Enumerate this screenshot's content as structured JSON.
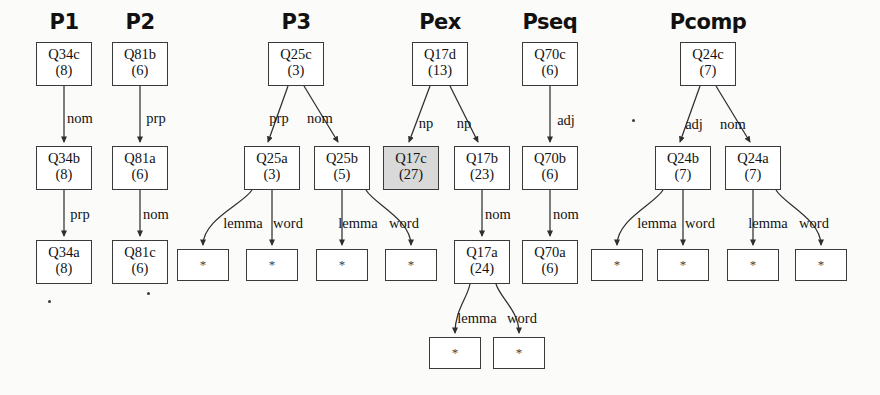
{
  "figure": {
    "background": "#fbfbf9",
    "node_fill": "#ffffff",
    "node_fill_highlight": "#d9d9d9",
    "stroke": "#3a3a3a",
    "leaf_symbol": "*"
  },
  "columns": [
    {
      "id": "p1",
      "label": "P1",
      "x": 64
    },
    {
      "id": "p2",
      "label": "P2",
      "x": 140
    },
    {
      "id": "p3",
      "label": "P3",
      "x": 296
    },
    {
      "id": "pex",
      "label": "Pex",
      "x": 440
    },
    {
      "id": "pseq",
      "label": "Pseq",
      "x": 550
    },
    {
      "id": "pcomp",
      "label": "Pcomp",
      "x": 708
    }
  ],
  "nodes": [
    {
      "id": "Q34c",
      "label": "Q34c",
      "count": "(8)",
      "cx": 64,
      "y": 42,
      "w": 56,
      "h": 44,
      "shaded": false
    },
    {
      "id": "Q34b",
      "label": "Q34b",
      "count": "(8)",
      "cx": 64,
      "y": 146,
      "w": 56,
      "h": 44,
      "shaded": false
    },
    {
      "id": "Q34a",
      "label": "Q34a",
      "count": "(8)",
      "cx": 64,
      "y": 240,
      "w": 56,
      "h": 44,
      "shaded": false
    },
    {
      "id": "Q81b",
      "label": "Q81b",
      "count": "(6)",
      "cx": 140,
      "y": 42,
      "w": 56,
      "h": 44,
      "shaded": false
    },
    {
      "id": "Q81a",
      "label": "Q81a",
      "count": "(6)",
      "cx": 140,
      "y": 146,
      "w": 56,
      "h": 44,
      "shaded": false
    },
    {
      "id": "Q81c",
      "label": "Q81c",
      "count": "(6)",
      "cx": 140,
      "y": 240,
      "w": 56,
      "h": 44,
      "shaded": false
    },
    {
      "id": "Q25c",
      "label": "Q25c",
      "count": "(3)",
      "cx": 296,
      "y": 42,
      "w": 56,
      "h": 44,
      "shaded": false
    },
    {
      "id": "Q25a",
      "label": "Q25a",
      "count": "(3)",
      "cx": 272,
      "y": 146,
      "w": 56,
      "h": 44,
      "shaded": false
    },
    {
      "id": "Q25b",
      "label": "Q25b",
      "count": "(5)",
      "cx": 342,
      "y": 146,
      "w": 56,
      "h": 44,
      "shaded": false
    },
    {
      "id": "Q17d",
      "label": "Q17d",
      "count": "(13)",
      "cx": 440,
      "y": 42,
      "w": 56,
      "h": 44,
      "shaded": false
    },
    {
      "id": "Q17c",
      "label": "Q17c",
      "count": "(27)",
      "cx": 411,
      "y": 146,
      "w": 56,
      "h": 44,
      "shaded": true
    },
    {
      "id": "Q17b",
      "label": "Q17b",
      "count": "(23)",
      "cx": 482,
      "y": 146,
      "w": 56,
      "h": 44,
      "shaded": false
    },
    {
      "id": "Q17a",
      "label": "Q17a",
      "count": "(24)",
      "cx": 482,
      "y": 240,
      "w": 56,
      "h": 44,
      "shaded": false
    },
    {
      "id": "Q70c",
      "label": "Q70c",
      "count": "(6)",
      "cx": 550,
      "y": 42,
      "w": 56,
      "h": 44,
      "shaded": false
    },
    {
      "id": "Q70b",
      "label": "Q70b",
      "count": "(6)",
      "cx": 550,
      "y": 146,
      "w": 56,
      "h": 44,
      "shaded": false
    },
    {
      "id": "Q70a",
      "label": "Q70a",
      "count": "(6)",
      "cx": 550,
      "y": 240,
      "w": 56,
      "h": 44,
      "shaded": false
    },
    {
      "id": "Q24c",
      "label": "Q24c",
      "count": "(7)",
      "cx": 708,
      "y": 42,
      "w": 56,
      "h": 44,
      "shaded": false
    },
    {
      "id": "Q24b",
      "label": "Q24b",
      "count": "(7)",
      "cx": 683,
      "y": 146,
      "w": 56,
      "h": 44,
      "shaded": false
    },
    {
      "id": "Q24a",
      "label": "Q24a",
      "count": "(7)",
      "cx": 753,
      "y": 146,
      "w": 56,
      "h": 44,
      "shaded": false
    }
  ],
  "leaves": [
    {
      "id": "leaf-p3-1",
      "symbol": "*",
      "cx": 203,
      "y": 249,
      "w": 52,
      "h": 32
    },
    {
      "id": "leaf-p3-2",
      "symbol": "*",
      "cx": 272,
      "y": 249,
      "w": 52,
      "h": 32
    },
    {
      "id": "leaf-p3-3",
      "symbol": "*",
      "cx": 342,
      "y": 249,
      "w": 52,
      "h": 32
    },
    {
      "id": "leaf-p3-4",
      "symbol": "*",
      "cx": 411,
      "y": 249,
      "w": 52,
      "h": 32
    },
    {
      "id": "leaf-pex-1",
      "symbol": "*",
      "cx": 455,
      "y": 337,
      "w": 52,
      "h": 32
    },
    {
      "id": "leaf-pex-2",
      "symbol": "*",
      "cx": 519,
      "y": 337,
      "w": 52,
      "h": 32
    },
    {
      "id": "leaf-pc-1",
      "symbol": "*",
      "cx": 617,
      "y": 249,
      "w": 52,
      "h": 32
    },
    {
      "id": "leaf-pc-2",
      "symbol": "*",
      "cx": 683,
      "y": 249,
      "w": 52,
      "h": 32
    },
    {
      "id": "leaf-pc-3",
      "symbol": "*",
      "cx": 753,
      "y": 249,
      "w": 52,
      "h": 32
    },
    {
      "id": "leaf-pc-4",
      "symbol": "*",
      "cx": 821,
      "y": 249,
      "w": 52,
      "h": 32
    }
  ],
  "edges": [
    {
      "id": "e-p1-1",
      "from": "Q34c",
      "to": "Q34b",
      "label": "nom",
      "lx": 80,
      "ly": 111,
      "x1": 64,
      "y1": 86,
      "x2": 64,
      "y2": 142,
      "curve": false
    },
    {
      "id": "e-p1-2",
      "from": "Q34b",
      "to": "Q34a",
      "label": "prp",
      "lx": 80,
      "ly": 207,
      "x1": 64,
      "y1": 190,
      "x2": 64,
      "y2": 236,
      "curve": false
    },
    {
      "id": "e-p2-1",
      "from": "Q81b",
      "to": "Q81a",
      "label": "prp",
      "lx": 156,
      "ly": 111,
      "x1": 140,
      "y1": 86,
      "x2": 140,
      "y2": 142,
      "curve": false
    },
    {
      "id": "e-p2-2",
      "from": "Q81a",
      "to": "Q81c",
      "label": "nom",
      "lx": 156,
      "ly": 207,
      "x1": 140,
      "y1": 190,
      "x2": 140,
      "y2": 236,
      "curve": false
    },
    {
      "id": "e-p3-1",
      "from": "Q25c",
      "to": "Q25a",
      "label": "prp",
      "lx": 279,
      "ly": 111,
      "x1": 288,
      "y1": 86,
      "x2": 268,
      "y2": 142,
      "curve": false
    },
    {
      "id": "e-p3-2",
      "from": "Q25c",
      "to": "Q25b",
      "label": "nom",
      "lx": 320,
      "ly": 111,
      "x1": 304,
      "y1": 86,
      "x2": 338,
      "y2": 142,
      "curve": false
    },
    {
      "id": "e-p3-3",
      "from": "Q25a",
      "to": "leaf-p3-1",
      "label": "lemma",
      "lx": 243,
      "ly": 216,
      "x1": 252,
      "y1": 190,
      "x2": 203,
      "y2": 245,
      "curve": true
    },
    {
      "id": "e-p3-4",
      "from": "Q25a",
      "to": "leaf-p3-2",
      "label": "word",
      "lx": 288,
      "ly": 216,
      "x1": 272,
      "y1": 190,
      "x2": 272,
      "y2": 245,
      "curve": false
    },
    {
      "id": "e-p3-5",
      "from": "Q25b",
      "to": "leaf-p3-3",
      "label": "lemma",
      "lx": 358,
      "ly": 216,
      "x1": 342,
      "y1": 190,
      "x2": 342,
      "y2": 245,
      "curve": false
    },
    {
      "id": "e-p3-6",
      "from": "Q25b",
      "to": "leaf-p3-4",
      "label": "word",
      "lx": 404,
      "ly": 216,
      "x1": 366,
      "y1": 190,
      "x2": 411,
      "y2": 245,
      "curve": true
    },
    {
      "id": "e-pex-1",
      "from": "Q17d",
      "to": "Q17c",
      "label": "np",
      "lx": 426,
      "ly": 116,
      "x1": 430,
      "y1": 86,
      "x2": 409,
      "y2": 142,
      "curve": false
    },
    {
      "id": "e-pex-2",
      "from": "Q17d",
      "to": "Q17b",
      "label": "np",
      "lx": 464,
      "ly": 116,
      "x1": 450,
      "y1": 86,
      "x2": 478,
      "y2": 142,
      "curve": false
    },
    {
      "id": "e-pex-3",
      "from": "Q17b",
      "to": "Q17a",
      "label": "nom",
      "lx": 498,
      "ly": 207,
      "x1": 482,
      "y1": 190,
      "x2": 482,
      "y2": 236,
      "curve": false
    },
    {
      "id": "e-pex-4",
      "from": "Q17a",
      "to": "leaf-pex-1",
      "label": "lemma",
      "lx": 477,
      "ly": 311,
      "x1": 470,
      "y1": 284,
      "x2": 455,
      "y2": 333,
      "curve": true
    },
    {
      "id": "e-pex-5",
      "from": "Q17a",
      "to": "leaf-pex-2",
      "label": "word",
      "lx": 522,
      "ly": 311,
      "x1": 496,
      "y1": 284,
      "x2": 519,
      "y2": 333,
      "curve": true
    },
    {
      "id": "e-pseq-1",
      "from": "Q70c",
      "to": "Q70b",
      "label": "adj",
      "lx": 566,
      "ly": 113,
      "x1": 550,
      "y1": 86,
      "x2": 550,
      "y2": 142,
      "curve": false
    },
    {
      "id": "e-pseq-2",
      "from": "Q70b",
      "to": "Q70a",
      "label": "nom",
      "lx": 566,
      "ly": 207,
      "x1": 550,
      "y1": 190,
      "x2": 550,
      "y2": 236,
      "curve": false
    },
    {
      "id": "e-pc-1",
      "from": "Q24c",
      "to": "Q24b",
      "label": "adj",
      "lx": 694,
      "ly": 117,
      "x1": 700,
      "y1": 86,
      "x2": 680,
      "y2": 142,
      "curve": false
    },
    {
      "id": "e-pc-2",
      "from": "Q24c",
      "to": "Q24a",
      "label": "nom",
      "lx": 733,
      "ly": 117,
      "x1": 716,
      "y1": 86,
      "x2": 750,
      "y2": 142,
      "curve": false
    },
    {
      "id": "e-pc-3",
      "from": "Q24b",
      "to": "leaf-pc-1",
      "label": "lemma",
      "lx": 657,
      "ly": 216,
      "x1": 663,
      "y1": 190,
      "x2": 617,
      "y2": 245,
      "curve": true
    },
    {
      "id": "e-pc-4",
      "from": "Q24b",
      "to": "leaf-pc-2",
      "label": "word",
      "lx": 700,
      "ly": 216,
      "x1": 683,
      "y1": 190,
      "x2": 683,
      "y2": 245,
      "curve": false
    },
    {
      "id": "e-pc-5",
      "from": "Q24a",
      "to": "leaf-pc-3",
      "label": "lemma",
      "lx": 768,
      "ly": 216,
      "x1": 753,
      "y1": 190,
      "x2": 753,
      "y2": 245,
      "curve": false
    },
    {
      "id": "e-pc-6",
      "from": "Q24a",
      "to": "leaf-pc-4",
      "label": "word",
      "lx": 814,
      "ly": 216,
      "x1": 776,
      "y1": 190,
      "x2": 821,
      "y2": 245,
      "curve": true
    }
  ],
  "specks": [
    {
      "x": 632,
      "y": 119
    },
    {
      "x": 48,
      "y": 300
    },
    {
      "x": 147,
      "y": 292
    }
  ]
}
